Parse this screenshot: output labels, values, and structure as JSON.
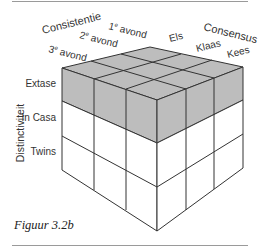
{
  "figure": {
    "caption": "Figuur 3.2b",
    "axes": {
      "consistency": {
        "title": "Consistentie",
        "items": [
          "3e avond",
          "2e avond",
          "1e avond"
        ]
      },
      "consensus": {
        "title": "Consensus",
        "items": [
          "Kees",
          "Klaas",
          "Els"
        ]
      },
      "distinctiveness": {
        "title": "Distinctiviteit",
        "items": [
          "Extase",
          "In Casa",
          "Twins"
        ]
      }
    },
    "highlighted_layer": "Extase",
    "colors": {
      "highlight": "#bdbdbd",
      "line": "#333333",
      "face": "#ffffff"
    }
  }
}
